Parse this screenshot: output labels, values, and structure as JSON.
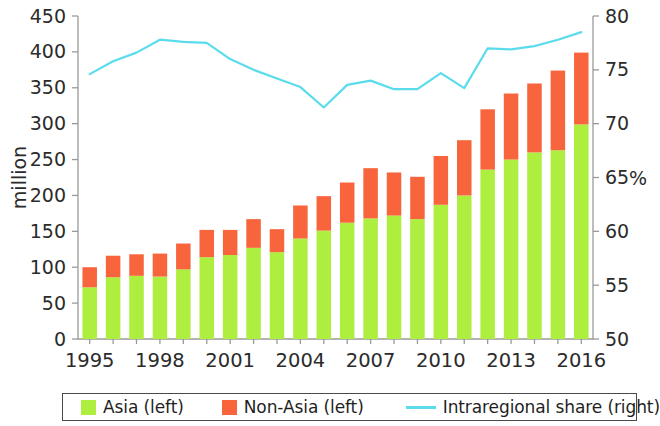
{
  "chart_data": {
    "type": "bar",
    "title": "",
    "subtitle": "",
    "xlabel": "",
    "ylabel": "million",
    "y2label": "%",
    "ylim": [
      0,
      450
    ],
    "y2lim": [
      50,
      80
    ],
    "yticks": [
      0,
      50,
      100,
      150,
      200,
      250,
      300,
      350,
      400,
      450
    ],
    "y2ticks": [
      50,
      55,
      60,
      65,
      70,
      75,
      80
    ],
    "grid": false,
    "legend_position": "bottom",
    "stacked": true,
    "categories": [
      1995,
      1996,
      1997,
      1998,
      1999,
      2000,
      2001,
      2002,
      2003,
      2004,
      2005,
      2006,
      2007,
      2008,
      2009,
      2010,
      2011,
      2012,
      2013,
      2014,
      2015,
      2016
    ],
    "xtick_labels": [
      "1995",
      "",
      "",
      "1998",
      "",
      "",
      "2001",
      "",
      "",
      "2004",
      "",
      "",
      "2007",
      "",
      "",
      "2010",
      "",
      "",
      "2013",
      "",
      "",
      "2016"
    ],
    "series": [
      {
        "name": "Asia (left)",
        "axis": "left",
        "type": "bar",
        "color": "#AEEE3E",
        "values": [
          72,
          86,
          88,
          87,
          97,
          114,
          117,
          127,
          121,
          140,
          151,
          162,
          168,
          172,
          167,
          187,
          200,
          236,
          250,
          260,
          263,
          299
        ]
      },
      {
        "name": "Non-Asia (left)",
        "axis": "left",
        "type": "bar",
        "color": "#F8653C",
        "values": [
          28,
          30,
          30,
          32,
          36,
          38,
          35,
          40,
          32,
          46,
          48,
          56,
          70,
          60,
          59,
          68,
          77,
          84,
          92,
          96,
          111,
          100
        ]
      },
      {
        "name": "Intraregional share (right)",
        "axis": "right",
        "type": "line",
        "color": "#5BDCEC",
        "values": [
          74.6,
          75.8,
          76.6,
          77.8,
          77.6,
          77.5,
          76.0,
          75.0,
          74.2,
          73.4,
          71.5,
          73.6,
          74.0,
          73.2,
          73.2,
          74.7,
          73.3,
          77.0,
          76.9,
          77.2,
          77.8,
          78.5
        ]
      }
    ],
    "totals": [
      100,
      116,
      118,
      119,
      133,
      152,
      152,
      167,
      153,
      186,
      199,
      218,
      238,
      232,
      226,
      255,
      277,
      320,
      342,
      356,
      374,
      399
    ]
  },
  "legend": {
    "items": [
      {
        "label": "Asia (left)",
        "marker": "square",
        "color": "#AEEE3E"
      },
      {
        "label": "Non-Asia (left)",
        "marker": "square",
        "color": "#F8653C"
      },
      {
        "label": "Intraregional share (right)",
        "marker": "line",
        "color": "#5BDCEC"
      }
    ]
  }
}
